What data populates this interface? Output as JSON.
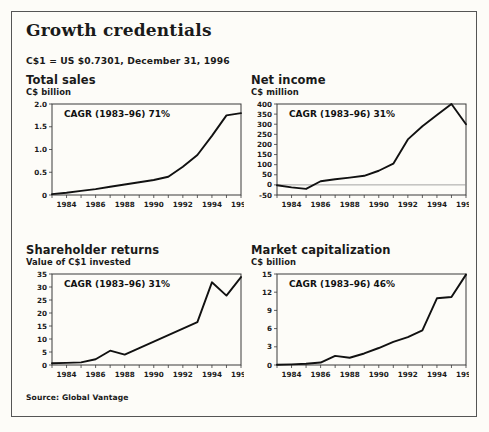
{
  "exhibit": {
    "title": "Growth credentials",
    "fx_note": "C$1 = US $0.7301, December 31, 1996",
    "source": "Source: Global Vantage"
  },
  "chart_data": [
    {
      "type": "line",
      "title": "Total sales",
      "ylabel": "C$ billion",
      "annotation": "CAGR (1983–96) 71%",
      "x": [
        1983,
        1984,
        1985,
        1986,
        1987,
        1988,
        1989,
        1990,
        1991,
        1992,
        1993,
        1994,
        1995,
        1996
      ],
      "values": [
        0.02,
        0.05,
        0.09,
        0.13,
        0.18,
        0.23,
        0.28,
        0.33,
        0.4,
        0.62,
        0.88,
        1.3,
        1.75,
        1.8
      ],
      "xticks": [
        1984,
        1986,
        1988,
        1990,
        1992,
        1994,
        1996
      ],
      "yticks": [
        0,
        0.5,
        1.0,
        1.5,
        2.0
      ],
      "yticklabels": [
        "0",
        "0.5",
        "1.0",
        "1.5",
        "2.0"
      ],
      "ylim": [
        0,
        2.0
      ],
      "xlim": [
        1983,
        1996
      ],
      "grid": false,
      "zeroline": false
    },
    {
      "type": "line",
      "title": "Net income",
      "ylabel": "C$ million",
      "annotation": "CAGR (1983–96) 31%",
      "x": [
        1983,
        1984,
        1985,
        1986,
        1987,
        1988,
        1989,
        1990,
        1991,
        1992,
        1993,
        1994,
        1995,
        1996
      ],
      "values": [
        -2,
        -12,
        -20,
        18,
        28,
        36,
        45,
        70,
        105,
        225,
        290,
        345,
        400,
        300
      ],
      "xticks": [
        1984,
        1986,
        1988,
        1990,
        1992,
        1994,
        1996
      ],
      "yticks": [
        -50,
        0,
        50,
        100,
        150,
        200,
        250,
        300,
        350,
        400
      ],
      "yticklabels": [
        "-50",
        "0",
        "50",
        "100",
        "150",
        "200",
        "250",
        "300",
        "350",
        "400"
      ],
      "ylim": [
        -50,
        400
      ],
      "xlim": [
        1983,
        1996
      ],
      "grid": false,
      "zeroline": true
    },
    {
      "type": "line",
      "title": "Shareholder returns",
      "ylabel": "Value of C$1 invested",
      "annotation": "CAGR (1983–96) 31%",
      "x": [
        1983,
        1984,
        1985,
        1986,
        1987,
        1988,
        1989,
        1990,
        1991,
        1992,
        1993,
        1994,
        1995,
        1996
      ],
      "values": [
        0.7,
        0.8,
        1.0,
        2.2,
        5.5,
        4.0,
        6.5,
        9.0,
        11.5,
        14.0,
        16.5,
        31.8,
        26.7,
        33.8
      ],
      "xticks": [
        1984,
        1986,
        1988,
        1990,
        1992,
        1994,
        1996
      ],
      "yticks": [
        0,
        5,
        10,
        15,
        20,
        25,
        30,
        35
      ],
      "yticklabels": [
        "0",
        "5",
        "10",
        "15",
        "20",
        "25",
        "30",
        "35"
      ],
      "ylim": [
        0,
        35
      ],
      "xlim": [
        1983,
        1996
      ],
      "grid": false,
      "zeroline": false
    },
    {
      "type": "line",
      "title": "Market capitalization",
      "ylabel": "C$ billion",
      "annotation": "CAGR (1983–96) 46%",
      "x": [
        1983,
        1984,
        1985,
        1986,
        1987,
        1988,
        1989,
        1990,
        1991,
        1992,
        1993,
        1994,
        1995,
        1996
      ],
      "values": [
        0.05,
        0.1,
        0.2,
        0.4,
        1.5,
        1.2,
        1.9,
        2.8,
        3.8,
        4.6,
        5.7,
        11.0,
        11.2,
        14.9
      ],
      "xticks": [
        1984,
        1986,
        1988,
        1990,
        1992,
        1994,
        1996
      ],
      "yticks": [
        0,
        3,
        6,
        9,
        12,
        15
      ],
      "yticklabels": [
        "0",
        "3",
        "6",
        "9",
        "12",
        "15"
      ],
      "ylim": [
        0,
        15
      ],
      "xlim": [
        1983,
        1996
      ],
      "grid": false,
      "zeroline": false
    }
  ]
}
